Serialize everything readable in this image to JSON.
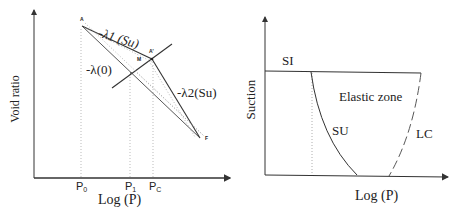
{
  "left_diagram": {
    "y_axis_label": "Void ratio",
    "x_axis_label": "Log (P)",
    "x_ticks": [
      {
        "base": "P",
        "sub": "0"
      },
      {
        "base": "P",
        "sub": "1"
      },
      {
        "base": "P",
        "sub": "C"
      }
    ],
    "points": {
      "A": "A",
      "A_prime": "A'",
      "M": "M",
      "F": "F"
    },
    "slope_labels": {
      "lambda1": "-λ1 (Su)",
      "lambda0": "-λ(0)",
      "lambda2": "-λ2(Su)"
    },
    "colors": {
      "line": "#333333",
      "dotted": "#999999"
    }
  },
  "right_diagram": {
    "y_axis_label": "Suction",
    "x_axis_label": "Log (P)",
    "curve_labels": {
      "si": "SI",
      "su": "SU",
      "lc": "LC"
    },
    "region_label": "Elastic zone",
    "colors": {
      "line": "#333333",
      "dotted": "#999999"
    }
  }
}
